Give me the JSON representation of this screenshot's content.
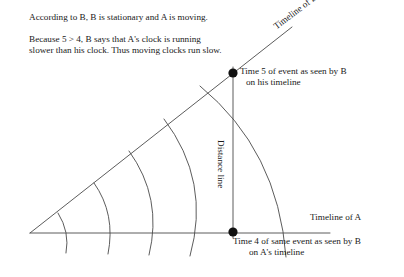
{
  "figure": {
    "kind": "minkowski-spacetime-diagram",
    "paragraphs": {
      "p1": "According to B, B is stationary and A is moving.",
      "p2_line1": "Because 5 > 4, B says that A's clock is running",
      "p2_line2": "slower than his clock. Thus moving clocks run slow."
    },
    "labels": {
      "timeline_of_b": "Timeline of B",
      "timeline_of_a": "Timeline of A",
      "distance_line": "Distance line",
      "event_top_line1": "Time 5 of event as seen by B",
      "event_top_line2": "on his timeline",
      "event_bottom_line1": "Time 4 of same event as seen by B",
      "event_bottom_line2": "on A's timeline"
    },
    "geometry": {
      "origin": {
        "x": 30,
        "y": 233
      },
      "event_top": {
        "x": 233,
        "y": 73
      },
      "event_bottom": {
        "x": 233,
        "y": 232
      },
      "axis_end": {
        "x": 330,
        "y": 233
      },
      "worldline_end": {
        "x": 290,
        "y": 38
      },
      "arc_count": 5,
      "arc_radii_label": [
        1,
        2,
        3,
        4,
        5
      ],
      "arc_axis_crossings_x": [
        70,
        112,
        152,
        193,
        233
      ],
      "worldline_angle_deg": -38
    },
    "colors": {
      "ink": "#1a1a1a",
      "line": "#4a4a4a",
      "background": "#ffffff",
      "node": "#111111"
    }
  }
}
